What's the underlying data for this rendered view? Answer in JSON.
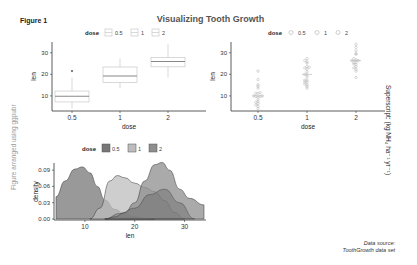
{
  "figure": {
    "label": "Figure 1",
    "title": "Visualizing Tooth Growth",
    "left_annotation": "Figure arranged using ggpubr",
    "right_annotation": "Superscript: (kg NH₄ ha⁻¹ yr⁻¹)",
    "source_line1": "Data source:",
    "source_line2": "ToothGrowth data set"
  },
  "colors": {
    "box_outline": "#c8c8c8",
    "median": "#888888",
    "axis": "#333333",
    "dot": "#b0b0b0",
    "density_05": "#777777",
    "density_1": "#bdbdbd",
    "density_2": "#8e8e8e"
  },
  "chart_data": [
    {
      "type": "box",
      "title": "",
      "xlabel": "dose",
      "ylabel": "len",
      "legend_title": "dose",
      "legend_position": "top",
      "categories": [
        "0.5",
        "1",
        "2"
      ],
      "yticks": [
        "10",
        "20",
        "30"
      ],
      "ylim": [
        3,
        35
      ],
      "boxes": [
        {
          "dose": "0.5",
          "min": 4.2,
          "q1": 7.2,
          "median": 9.85,
          "q3": 12.25,
          "max": 18.5,
          "outliers": [
            21.5
          ]
        },
        {
          "dose": "1",
          "min": 13.6,
          "q1": 16.25,
          "median": 19.25,
          "q3": 23.4,
          "max": 27.3,
          "outliers": []
        },
        {
          "dose": "2",
          "min": 18.5,
          "q1": 23.5,
          "median": 25.95,
          "q3": 27.8,
          "max": 33.9,
          "outliers": []
        }
      ]
    },
    {
      "type": "dotplot",
      "xlabel": "dose",
      "ylabel": "len",
      "legend_title": "dose",
      "legend_position": "top",
      "categories": [
        "0.5",
        "1",
        "2"
      ],
      "yticks": [
        "10",
        "20",
        "30"
      ],
      "ylim": [
        3,
        35
      ],
      "points": {
        "0.5": [
          4.2,
          5.2,
          5.8,
          6.4,
          7.0,
          7.3,
          8.2,
          9.4,
          9.7,
          9.7,
          10.0,
          10.0,
          11.2,
          11.2,
          11.5,
          13.6,
          14.5,
          15.2,
          17.6,
          21.5
        ],
        "1": [
          13.6,
          14.5,
          15.2,
          15.5,
          16.5,
          16.5,
          17.3,
          17.3,
          18.8,
          19.7,
          20.0,
          21.2,
          22.4,
          23.0,
          23.3,
          23.6,
          25.2,
          25.8,
          26.4,
          27.3
        ],
        "2": [
          18.5,
          21.5,
          22.4,
          23.0,
          23.6,
          24.5,
          24.8,
          25.5,
          25.5,
          26.4,
          26.4,
          26.7,
          27.3,
          29.4,
          29.5,
          30.9,
          32.5,
          33.9
        ]
      }
    },
    {
      "type": "area",
      "subtype": "density",
      "xlabel": "len",
      "ylabel": "density",
      "legend_title": "dose",
      "legend_position": "top",
      "xticks": [
        "10",
        "20",
        "30"
      ],
      "yticks": [
        "0.00",
        "0.03",
        "0.06",
        "0.09"
      ],
      "xlim": [
        4.2,
        33.9
      ],
      "ylim": [
        0,
        0.105
      ],
      "series": [
        {
          "name": "0.5",
          "x": [
            4.2,
            6,
            8,
            9.5,
            11,
            12.5,
            14,
            16,
            18,
            20,
            22,
            24
          ],
          "y": [
            0.041,
            0.07,
            0.092,
            0.096,
            0.085,
            0.06,
            0.035,
            0.018,
            0.009,
            0.004,
            0.001,
            0.0
          ]
        },
        {
          "name": "1",
          "x": [
            11,
            13,
            15,
            16.5,
            18,
            20,
            22,
            24,
            26,
            28,
            30
          ],
          "y": [
            0.0,
            0.02,
            0.07,
            0.08,
            0.076,
            0.066,
            0.058,
            0.05,
            0.034,
            0.012,
            0.0
          ]
        },
        {
          "name": "2",
          "x": [
            14,
            16,
            18,
            20,
            22,
            24,
            25.5,
            27,
            29,
            31,
            33.9
          ],
          "y": [
            0.0,
            0.004,
            0.012,
            0.03,
            0.07,
            0.1,
            0.104,
            0.09,
            0.055,
            0.038,
            0.026
          ]
        }
      ],
      "overlap_band": {
        "x": [
          14,
          17,
          20,
          23,
          26,
          29,
          32
        ],
        "y": [
          0.0,
          0.01,
          0.02,
          0.045,
          0.055,
          0.03,
          0.0
        ]
      }
    }
  ]
}
